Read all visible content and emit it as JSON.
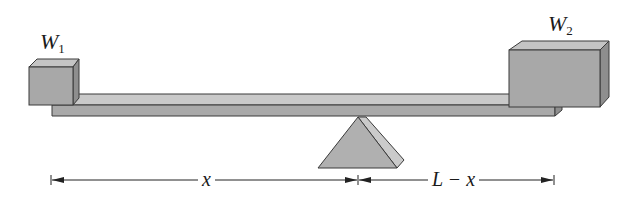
{
  "diagram": {
    "type": "seesaw-lever",
    "colors": {
      "block_front": "#a8a8a8",
      "block_top": "#c4c4c4",
      "block_side": "#8e8e8e",
      "beam_top": "#c8c8c8",
      "beam_front": "#a9a9a9",
      "fulcrum_front": "#b0b0b0",
      "fulcrum_side": "#c9c9c9",
      "outline": "#3a3a3a",
      "dimension_line": "#222222"
    },
    "weights": [
      {
        "id": "w1",
        "symbol": "W",
        "subscript": "1",
        "position": "left"
      },
      {
        "id": "w2",
        "symbol": "W",
        "subscript": "2",
        "position": "right"
      }
    ],
    "dimensions": [
      {
        "id": "x",
        "label": "x",
        "from": "left end",
        "to": "fulcrum"
      },
      {
        "id": "l_minus_x",
        "label": "L − x",
        "from": "fulcrum",
        "to": "right end"
      }
    ]
  }
}
